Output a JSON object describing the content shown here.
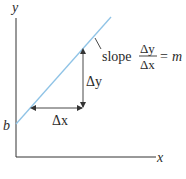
{
  "diagram": {
    "axes": {
      "x_label": "x",
      "y_label": "y"
    },
    "intercept_label": "b",
    "delta_x_label": "Δx",
    "delta_y_label": "Δy",
    "slope_annotation": {
      "word": "slope",
      "numerator": "Δy",
      "denominator": "Δx",
      "equals": "=",
      "result": "m"
    },
    "colors": {
      "line": "#8fc3e6",
      "axes": "#333333",
      "text": "#2b2b2b"
    }
  }
}
